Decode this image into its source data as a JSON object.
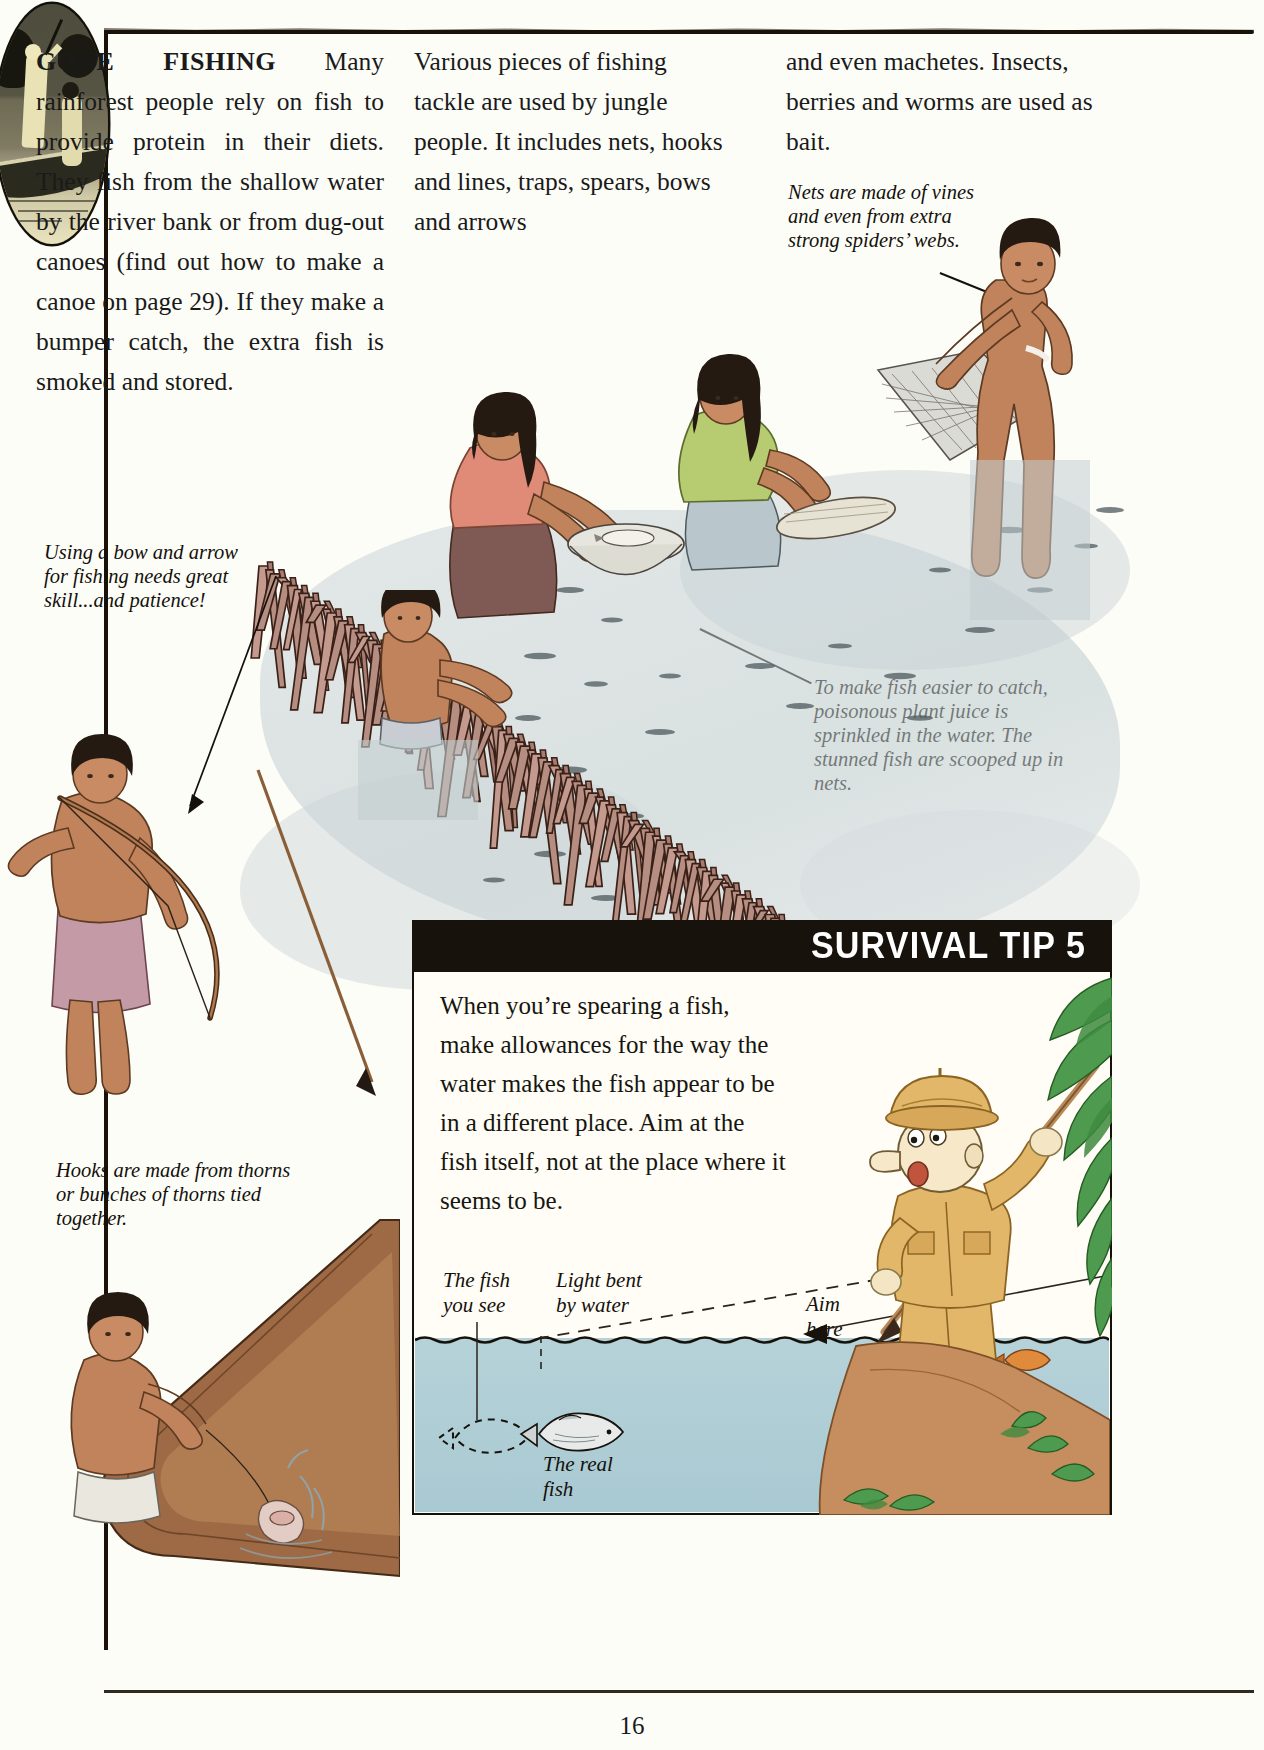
{
  "page": {
    "number": "16",
    "heading": "GONE FISHING"
  },
  "columns": {
    "col1_heading": "GONE FISHING",
    "col1_body": "Many rainforest people rely on fish to provide protein in their diets. They fish from the shallow water by the river bank or from dug-out canoes (find out how to make a canoe on page 29). If they make a bumper catch, the extra fish is smoked and stored.",
    "col2_body": "Various pieces of fishing tackle are used by jungle people. It includes nets, hooks and lines, traps, spears, bows and arrows",
    "col3_body": "and even machetes. Insects, berries and worms are used as bait."
  },
  "captions": {
    "bow_arrow": "Using a bow and arrow for fishing needs great skill...and patience!",
    "hooks": "Hooks are made from thorns or bunches of thorns tied together.",
    "nets": "Nets are made of vines and even from extra strong spiders’ webs.",
    "poison": "To make fish easier to catch, poisonous plant juice is sprinkled in the water. The stunned fish are scooped up in nets."
  },
  "survival_tip": {
    "banner": "SURVIVAL TIP 5",
    "body": "When you’re spearing a fish, make allowances for the way the water makes the fish appear to be in a different place. Aim at the fish itself, not at the place where it seems to be.",
    "label_fish_you_see": "The fish\nyou see",
    "label_light_bent": "Light bent\nby water",
    "label_aim_here": "Aim\nhere",
    "label_real_fish": "The real\nfish"
  },
  "colors": {
    "ink": "#17120c",
    "paper": "#fdfdf8",
    "water": "#b6d2d9",
    "river": "#c3ced1",
    "skin": "#c98b63",
    "khaki": "#e3b76a",
    "foliage": "#3f8b3f",
    "stick": "#b38b80"
  }
}
